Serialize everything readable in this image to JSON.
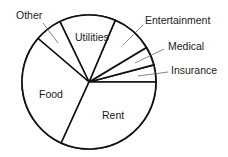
{
  "chart_data": {
    "type": "pie",
    "title": "",
    "center": [
      89,
      82
    ],
    "radius": 67,
    "start_angle_deg": 0,
    "direction": "counterclockwise",
    "stroke_color": "#111111",
    "fill_color": "#ffffff",
    "slices": [
      {
        "label": "Insurance",
        "value": 4.1,
        "degrees": 14.8,
        "label_inside": false,
        "label_pos": [
          171,
          74
        ],
        "leader": [
          [
            168,
            72
          ],
          [
            138,
            76
          ]
        ]
      },
      {
        "label": "Medical",
        "value": 4.5,
        "degrees": 16.2,
        "label_inside": false,
        "label_pos": [
          168,
          50
        ],
        "leader": [
          [
            164,
            49
          ],
          [
            135,
            63
          ]
        ]
      },
      {
        "label": "Entertainment",
        "value": 10.0,
        "degrees": 36.0,
        "label_inside": false,
        "label_pos": [
          145,
          24
        ],
        "leader": [
          [
            143,
            25
          ],
          [
            123,
            45
          ]
        ]
      },
      {
        "label": "Utilities",
        "value": 13.5,
        "degrees": 48.7,
        "label_inside": true,
        "label_pos": [
          75,
          41
        ]
      },
      {
        "label": "Other",
        "value": 6.6,
        "degrees": 23.8,
        "label_inside": false,
        "label_pos": [
          16,
          19
        ],
        "leader": [
          [
            43,
            23
          ],
          [
            58,
            43
          ]
        ]
      },
      {
        "label": "Food",
        "value": 29.4,
        "degrees": 106.0,
        "label_inside": true,
        "label_pos": [
          39,
          98
        ]
      },
      {
        "label": "Rent",
        "value": 31.9,
        "degrees": 114.5,
        "label_inside": true,
        "label_pos": [
          102,
          119
        ]
      }
    ],
    "legend": "none",
    "grid": false
  }
}
